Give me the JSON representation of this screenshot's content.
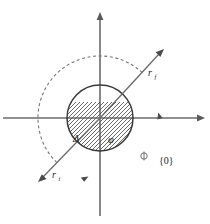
{
  "figure": {
    "background_color": "#ffffff",
    "width": 210,
    "height": 224
  },
  "axes": {
    "origin": {
      "x": 100,
      "y": 118
    },
    "horizontal": {
      "name": "horizontal-axis",
      "x_start": 3,
      "x_end": 205,
      "y": 118,
      "arrow_at_end": true,
      "arrow_at_start": false,
      "color": "#6b6b6b"
    },
    "vertical": {
      "name": "vertical-axis",
      "y_start": 12,
      "y_end": 216,
      "x": 100,
      "arrow_at_start": true,
      "arrow_at_end": false,
      "color": "#6b6b6b"
    }
  },
  "disk": {
    "name": "hatched-disk",
    "center_x": 100,
    "center_y": 118,
    "radius": 33,
    "outline_color": "#3a3a3a",
    "hatch_color": "#4d4d4d",
    "hatch_angle_deg": 45,
    "hatch_spacing": 3
  },
  "center_point": {
    "name": "origin-dot",
    "x": 100,
    "y": 118,
    "radius": 5,
    "color": "#000000"
  },
  "vectors": [
    {
      "id": "r-final",
      "label": "r",
      "subscript": "f",
      "from_x": 100,
      "from_y": 118,
      "to_x": 164,
      "to_y": 49,
      "label_x": 150,
      "label_y": 73,
      "color": "#6b6b6b",
      "direction": "upper-right"
    },
    {
      "id": "r-initial",
      "label": "r",
      "subscript": "i",
      "from_x": 100,
      "from_y": 118,
      "to_x": 38,
      "to_y": 182,
      "label_x": 54,
      "label_y": 175,
      "color": "#6b6b6b",
      "direction": "lower-left"
    }
  ],
  "arc": {
    "name": "scattering-angle-arc",
    "center_x": 100,
    "center_y": 118,
    "radius": 62,
    "start_angle_deg": 47,
    "end_angle_deg": 227,
    "sweep_direction": "clockwise-through-bottom",
    "style": "dashed",
    "color": "#777777",
    "markers": [
      {
        "name": "arc-marker-upper",
        "x": 162,
        "y": 118
      },
      {
        "name": "arc-marker-lower",
        "x": 86,
        "y": 179
      }
    ],
    "phi_symbol": {
      "name": "phi-marker-on-arc",
      "x": 144,
      "y": 156,
      "radius": 3.2
    }
  },
  "labels": {
    "delta": {
      "name": "delta-label",
      "text": "Δ",
      "x": 78,
      "y": 138,
      "description": "interaction region width inside disk"
    },
    "phi": {
      "name": "phi-label",
      "text": "φ",
      "x": 112,
      "y": 139,
      "description": "scattering angle at origin"
    },
    "set_zero": {
      "name": "set-zero-label",
      "text": "{0}",
      "x": 166,
      "y": 160,
      "description": "zero set annotation outside arc"
    }
  }
}
